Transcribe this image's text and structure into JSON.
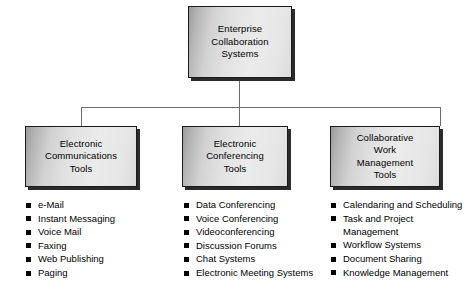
{
  "diagram": {
    "root": {
      "label": "Enterprise Collaboration Systems",
      "line1": "Enterprise",
      "line2": "Collaboration",
      "line3": "Systems"
    },
    "branches": [
      {
        "id": "electronic-communications-tools",
        "title": "Electronic Communications Tools",
        "title_lines": [
          "Electronic",
          "Communications",
          "Tools"
        ],
        "items": [
          "e-Mail",
          "Instant Messaging",
          "Voice Mail",
          "Faxing",
          "Web Publishing",
          "Paging"
        ]
      },
      {
        "id": "electronic-conferencing-tools",
        "title": "Electronic Conferencing Tools",
        "title_lines": [
          "Electronic",
          "Conferencing",
          "Tools"
        ],
        "items": [
          "Data Conferencing",
          "Voice Conferencing",
          "Videoconferencing",
          "Discussion Forums",
          "Chat Systems",
          "Electronic Meeting Systems"
        ]
      },
      {
        "id": "collaborative-work-management-tools",
        "title": "Collaborative Work Management Tools",
        "title_lines": [
          "Collaborative",
          "Work",
          "Management",
          "Tools"
        ],
        "items": [
          "Calendaring and Scheduling",
          "Task and Project Management",
          "Workflow Systems",
          "Document Sharing",
          "Knowledge Management"
        ]
      }
    ]
  },
  "colors": {
    "background": "#ffffff",
    "box_border": "#1a1a1a",
    "box_shadow": "#2b2b2b",
    "connector": "#6d6d6d",
    "text": "#000000",
    "bullet": "#000000"
  }
}
